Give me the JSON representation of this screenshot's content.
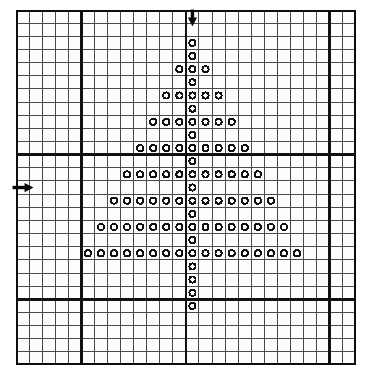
{
  "figure": {
    "title": "",
    "kind": "grid-paper-plot"
  },
  "colors": {
    "background": "#ffffff",
    "paper": "#fcfcfc",
    "minor_grid": "#4a4a4a",
    "major_grid": "#111111",
    "border": "#0d0d0d",
    "marker_stroke": "#111111",
    "marker_fill": "#ffffff",
    "arrow": "#0a0a0a"
  },
  "grid": {
    "columns": 26,
    "rows": 27,
    "cell_width": 13.07,
    "cell_height": 13.15,
    "minor_line_width": 1,
    "major_line_width": 2.6,
    "border_line_width": 3.2,
    "major_columns": [
      0,
      5,
      13,
      24,
      26
    ],
    "major_rows": [
      0,
      11,
      22,
      27
    ]
  },
  "axes": {
    "vertical_axis_column": 13,
    "horizontal_axis_row": 11
  },
  "markers": {
    "shape": "open-circle",
    "radius": 3.1,
    "stroke_width": 1.9
  },
  "arrows": [
    {
      "name": "down-arrow",
      "direction": "down",
      "column": 13,
      "row": 0,
      "label": ""
    },
    {
      "name": "right-arrow",
      "direction": "right",
      "column": 0,
      "row": 13,
      "label": ""
    }
  ],
  "chart_data": {
    "type": "scatter",
    "title": "",
    "xlabel": "",
    "ylabel": "",
    "xlim": [
      0,
      26
    ],
    "ylim": [
      0,
      27
    ],
    "grid": true,
    "legend": null,
    "marker": "open-circle",
    "center_column": 13,
    "note": "Points given as [column, row] grid indices, origin at top-left cell of the grid.",
    "rows": [
      {
        "row": 2,
        "columns": [
          13
        ]
      },
      {
        "row": 3,
        "columns": [
          13
        ]
      },
      {
        "row": 4,
        "columns": [
          12,
          13,
          14
        ]
      },
      {
        "row": 5,
        "columns": [
          13
        ]
      },
      {
        "row": 6,
        "columns": [
          11,
          12,
          13,
          14,
          15
        ]
      },
      {
        "row": 7,
        "columns": [
          13
        ]
      },
      {
        "row": 8,
        "columns": [
          10,
          11,
          12,
          13,
          14,
          15,
          16
        ]
      },
      {
        "row": 9,
        "columns": [
          13
        ]
      },
      {
        "row": 10,
        "columns": [
          9,
          10,
          11,
          12,
          13,
          14,
          15,
          16,
          17
        ]
      },
      {
        "row": 11,
        "columns": [
          13
        ]
      },
      {
        "row": 12,
        "columns": [
          8,
          9,
          10,
          11,
          12,
          13,
          14,
          15,
          16,
          17,
          18
        ]
      },
      {
        "row": 13,
        "columns": [
          13
        ]
      },
      {
        "row": 14,
        "columns": [
          7,
          8,
          9,
          10,
          11,
          12,
          13,
          14,
          15,
          16,
          17,
          18,
          19
        ]
      },
      {
        "row": 15,
        "columns": [
          13
        ]
      },
      {
        "row": 16,
        "columns": [
          6,
          7,
          8,
          9,
          10,
          11,
          12,
          13,
          14,
          15,
          16,
          17,
          18,
          19,
          20
        ]
      },
      {
        "row": 17,
        "columns": [
          13
        ]
      },
      {
        "row": 18,
        "columns": [
          5,
          6,
          7,
          8,
          9,
          10,
          11,
          12,
          13,
          14,
          15,
          16,
          17,
          18,
          19,
          20,
          21
        ]
      },
      {
        "row": 19,
        "columns": [
          13
        ]
      },
      {
        "row": 20,
        "columns": [
          13
        ]
      },
      {
        "row": 21,
        "columns": [
          13
        ]
      },
      {
        "row": 22,
        "columns": [
          13
        ]
      }
    ],
    "row_counts": [
      1,
      1,
      3,
      1,
      5,
      1,
      7,
      1,
      9,
      1,
      11,
      1,
      13,
      1,
      15,
      1,
      17,
      1,
      1,
      1,
      1
    ],
    "total_points": 105
  }
}
